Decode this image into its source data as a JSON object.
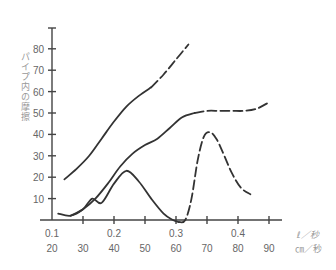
{
  "chart_data": {
    "type": "line",
    "title": "",
    "ylabel": "パイプ内の摩擦",
    "xlabel_primary_unit": "ℓ／秒",
    "xlabel_secondary_unit": "㎝／秒",
    "x_ticks_primary": [
      "0.1",
      "0.2",
      "0.3",
      "0.4"
    ],
    "x_ticks_primary_at_secondary": [
      20,
      40,
      60,
      80
    ],
    "x_ticks_secondary": [
      "20",
      "30",
      "40",
      "50",
      "60",
      "70",
      "80",
      "90"
    ],
    "y_ticks": [
      "10",
      "20",
      "30",
      "40",
      "50",
      "60",
      "70",
      "80"
    ],
    "ylim": [
      0,
      90
    ],
    "xlim_secondary": [
      20,
      100
    ],
    "grid": false,
    "series": [
      {
        "name": "upper curve",
        "style": "solid then dashed",
        "x": [
          24,
          28,
          32,
          36,
          40,
          44,
          48,
          52,
          56,
          60,
          64
        ],
        "y": [
          19,
          24,
          30,
          38,
          46,
          53,
          58,
          62,
          68,
          75,
          82
        ],
        "dashed_from_x": 50
      },
      {
        "name": "middle curve",
        "style": "solid then dashed",
        "x": [
          26,
          30,
          34,
          38,
          42,
          46,
          50,
          54,
          58,
          62,
          66,
          70,
          74,
          78,
          82,
          86,
          90
        ],
        "y": [
          2,
          5,
          10,
          17,
          25,
          31,
          35,
          38,
          43,
          48,
          50,
          51,
          51,
          51,
          51,
          52,
          55
        ],
        "dashed_from_x": 64
      },
      {
        "name": "lower curve",
        "style": "solid then dashed",
        "x": [
          22,
          26,
          30,
          33,
          36,
          40,
          44,
          48,
          52,
          56,
          59,
          61,
          63,
          65,
          67,
          69,
          71,
          73,
          75,
          78,
          81,
          84
        ],
        "y": [
          3,
          2,
          5,
          10,
          8,
          17,
          23,
          18,
          10,
          3,
          0,
          -1,
          0,
          10,
          28,
          39,
          41,
          38,
          32,
          22,
          15,
          12
        ],
        "dashed_from_x": 61
      }
    ]
  }
}
